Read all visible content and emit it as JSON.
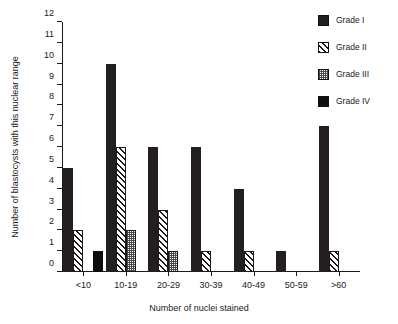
{
  "chart_data": {
    "type": "bar",
    "title": "",
    "xlabel": "Number of nuclei stained",
    "ylabel": "Number of blastocysts with this nuclear range",
    "categories": [
      "<10",
      "10-19",
      "20-29",
      "30-39",
      "40-49",
      "50-59",
      ">60"
    ],
    "series": [
      {
        "name": "Grade I",
        "values": [
          5,
          10,
          6,
          6,
          4,
          1,
          7
        ],
        "pattern": "solid-dark",
        "color": "#231f20"
      },
      {
        "name": "Grade II",
        "values": [
          2,
          6,
          3,
          1,
          1,
          0,
          1
        ],
        "pattern": "hatch",
        "color": "#ffffff"
      },
      {
        "name": "Grade III",
        "values": [
          0,
          2,
          1,
          0,
          0,
          0,
          0
        ],
        "pattern": "stipple",
        "color": "#8c8c8c"
      },
      {
        "name": "Grade IV",
        "values": [
          1,
          0,
          0,
          0,
          0,
          0,
          0
        ],
        "pattern": "solid-black",
        "color": "#0d0d0d"
      }
    ],
    "ylim": [
      0,
      12
    ],
    "yticks": [
      0,
      1,
      2,
      3,
      4,
      5,
      6,
      7,
      8,
      9,
      10,
      11,
      12
    ],
    "ytick_labels": [
      "0",
      "1",
      "2",
      "3",
      "4",
      "5",
      "6",
      "7",
      "8",
      "9",
      "10",
      "11",
      "12"
    ],
    "grid": false,
    "legend_position": "top-right"
  },
  "legend": {
    "entries": [
      {
        "label": "Grade I"
      },
      {
        "label": "Grade II"
      },
      {
        "label": "Grade III"
      },
      {
        "label": "Grade IV"
      }
    ]
  }
}
